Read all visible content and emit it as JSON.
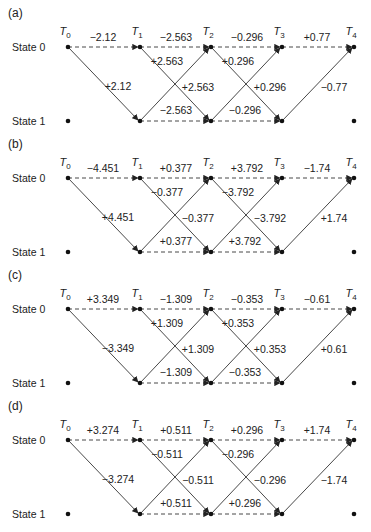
{
  "figure": {
    "state_labels": [
      "State 0",
      "State 1"
    ],
    "time_labels": [
      "T",
      "T",
      "T",
      "T",
      "T"
    ],
    "time_subscripts": [
      "0",
      "1",
      "2",
      "3",
      "4"
    ],
    "node_x": [
      68,
      140,
      211,
      282,
      354
    ],
    "panel_offsets": [
      0,
      131,
      262,
      393
    ],
    "row_y": [
      47,
      121
    ],
    "colors": {
      "line": "#333333",
      "text": "#222222",
      "background": "#ffffff"
    }
  },
  "panels": [
    {
      "label": "(a)",
      "edges": {
        "t0_00": "−2.12",
        "t0_01": "+2.12",
        "t1_00": "−2.563",
        "t1_01": "+2.563",
        "t1_10": "+2.563",
        "t1_11": "−2.563",
        "t2_00": "−0.296",
        "t2_01": "+0.296",
        "t2_10": "+0.296",
        "t2_11": "−0.296",
        "t3_00": "+0.77",
        "t3_10": "−0.77"
      }
    },
    {
      "label": "(b)",
      "edges": {
        "t0_00": "−4.451",
        "t0_01": "+4.451",
        "t1_00": "+0.377",
        "t1_01": "−0.377",
        "t1_10": "−0.377",
        "t1_11": "+0.377",
        "t2_00": "+3.792",
        "t2_01": "−3.792",
        "t2_10": "−3.792",
        "t2_11": "+3.792",
        "t3_00": "−1.74",
        "t3_10": "+1.74"
      }
    },
    {
      "label": "(c)",
      "edges": {
        "t0_00": "+3.349",
        "t0_01": "−3.349",
        "t1_00": "−1.309",
        "t1_01": "+1.309",
        "t1_10": "+1.309",
        "t1_11": "−1.309",
        "t2_00": "−0.353",
        "t2_01": "+0.353",
        "t2_10": "+0.353",
        "t2_11": "−0.353",
        "t3_00": "−0.61",
        "t3_10": "+0.61"
      }
    },
    {
      "label": "(d)",
      "edges": {
        "t0_00": "+3.274",
        "t0_01": "−3.274",
        "t1_00": "+0.511",
        "t1_01": "−0.511",
        "t1_10": "−0.511",
        "t1_11": "+0.511",
        "t2_00": "+0.296",
        "t2_01": "−0.296",
        "t2_10": "−0.296",
        "t2_11": "+0.296",
        "t3_00": "+1.74",
        "t3_10": "−1.74"
      }
    }
  ]
}
